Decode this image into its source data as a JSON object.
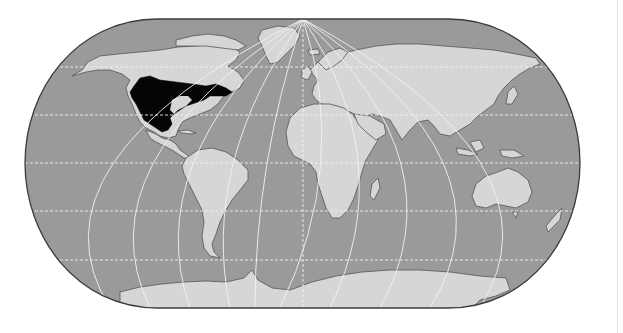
{
  "map": {
    "projection": "Eckert IV (pseudocylindrical, rounded poles)",
    "subject": "Distribution range (shaded black) in North America",
    "colors": {
      "ocean": "#9a9a9a",
      "land": "#d6d6d6",
      "coast": "#555555",
      "range": "#050505",
      "graticule": "#f2f2f2",
      "frame": "#3c3c3c",
      "background": "#ffffff"
    },
    "legend": [],
    "labels": [],
    "highlighted_region": {
      "name": "shaded-range",
      "description": "Black area covering most of the contiguous United States and southern Canada, east of the Rocky Mountains to the Atlantic, south into northern Mexico"
    },
    "graticule": {
      "parallels_deg": [
        -60,
        -30,
        0,
        30,
        60
      ],
      "meridians_spacing_deg": 30
    }
  }
}
